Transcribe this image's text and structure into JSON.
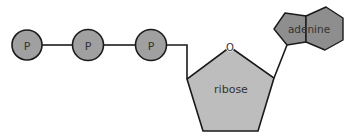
{
  "diagram": {
    "title": "",
    "colors": {
      "phosphate_fill": "#a0a0a0",
      "ribose_fill": "#bdbdbd",
      "adenine_fill": "#8e8e8e",
      "stroke": "#1a1a1a",
      "background": "#ffffff"
    },
    "phosphates": [
      {
        "label": "P"
      },
      {
        "label": "P"
      },
      {
        "label": "P"
      }
    ],
    "ribose": {
      "label": "ribose",
      "ring_oxygen_label": "O"
    },
    "adenine": {
      "label": "adenine"
    }
  }
}
